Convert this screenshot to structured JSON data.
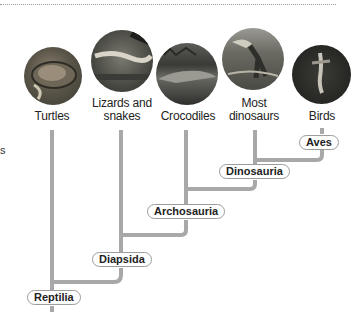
{
  "figure": {
    "taxa": [
      {
        "label_line1": "Turtles",
        "label_line2": "",
        "image": "turtle-photo"
      },
      {
        "label_line1": "Lizards and",
        "label_line2": "snakes",
        "image": "lizard-photo"
      },
      {
        "label_line1": "Crocodiles",
        "label_line2": "",
        "image": "crocodile-photo"
      },
      {
        "label_line1": "Most",
        "label_line2": "dinosaurs",
        "image": "dinosaur-photo"
      },
      {
        "label_line1": "Birds",
        "label_line2": "",
        "image": "bird-photo"
      }
    ],
    "clades": [
      {
        "label": "Aves"
      },
      {
        "label": "Dinosauria"
      },
      {
        "label": "Archosauria"
      },
      {
        "label": "Diapsida"
      },
      {
        "label": "Reptilia"
      }
    ],
    "stray_text": "s",
    "colors": {
      "branch": "#a8a8a8",
      "clade_border": "#9c9c9c"
    }
  }
}
